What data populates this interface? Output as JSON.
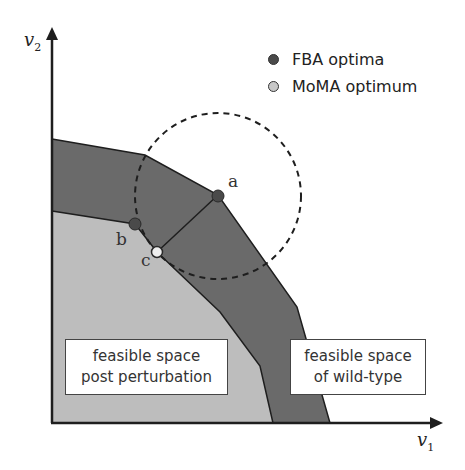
{
  "figure": {
    "axes": {
      "x_label": "v",
      "x_label_sub": "1",
      "y_label": "v",
      "y_label_sub": "2"
    },
    "legend": [
      {
        "label": "FBA optima",
        "color": "#4a4a4a"
      },
      {
        "label": "MoMA optimum",
        "color": "#c8c8c8"
      }
    ],
    "regions": {
      "wild_type": {
        "label_line1": "feasible space",
        "label_line2": "of wild-type",
        "color": "#6a6a6a"
      },
      "perturbation": {
        "label_line1": "feasible space",
        "label_line2": "post perturbation",
        "color": "#bdbdbd"
      }
    },
    "points": {
      "a": {
        "label": "a",
        "type": "FBA optimum"
      },
      "b": {
        "label": "b",
        "type": "FBA optimum"
      },
      "c": {
        "label": "c",
        "type": "MoMA optimum"
      }
    },
    "colors": {
      "dark_region": "#6a6a6a",
      "light_region": "#bdbdbd",
      "fba_point": "#4a4a4a",
      "moma_point": "#e6e6e6",
      "line": "#1e1e1e"
    }
  }
}
